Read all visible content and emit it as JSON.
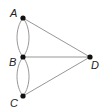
{
  "diagram": {
    "type": "graph",
    "colors": {
      "edge": "#8a8a8a",
      "node": "#111111",
      "label": "#222222",
      "background": "#ffffff"
    },
    "nodes": [
      {
        "id": "A",
        "label": "A",
        "x": 23,
        "y": 18
      },
      {
        "id": "B",
        "label": "B",
        "x": 23,
        "y": 57
      },
      {
        "id": "C",
        "label": "C",
        "x": 23,
        "y": 96
      },
      {
        "id": "D",
        "label": "D",
        "x": 90,
        "y": 57
      }
    ],
    "edges": [
      {
        "from": "A",
        "to": "B",
        "kind": "curve-left"
      },
      {
        "from": "A",
        "to": "B",
        "kind": "curve-right"
      },
      {
        "from": "B",
        "to": "C",
        "kind": "curve-left"
      },
      {
        "from": "B",
        "to": "C",
        "kind": "curve-right"
      },
      {
        "from": "A",
        "to": "D",
        "kind": "straight"
      },
      {
        "from": "B",
        "to": "D",
        "kind": "straight"
      },
      {
        "from": "C",
        "to": "D",
        "kind": "straight"
      }
    ]
  }
}
